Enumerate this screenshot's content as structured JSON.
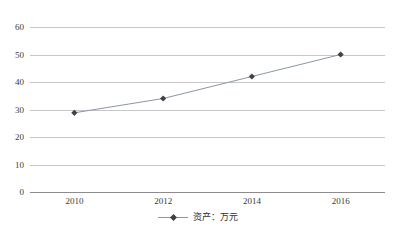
{
  "chart_data": {
    "type": "line",
    "title": "",
    "xlabel": "",
    "ylabel": "",
    "x": [
      "2010",
      "2012",
      "2014",
      "2016"
    ],
    "categories": [
      "2010",
      "2012",
      "2014",
      "2016"
    ],
    "series": [
      {
        "name": "资产：万元",
        "values": [
          28.8,
          34.0,
          42.0,
          50.0
        ],
        "marker": "diamond",
        "line_color": "#8b95a8",
        "marker_color": "#40404a"
      }
    ],
    "ylim": [
      0,
      60
    ],
    "yticks": [
      0,
      10,
      20,
      30,
      40,
      50,
      60
    ],
    "ytick_labels": [
      "0",
      "10",
      "20",
      "30",
      "40",
      "50",
      "60"
    ],
    "xtick_labels": [
      "2010",
      "2012",
      "2014",
      "2016"
    ],
    "grid": true,
    "grid_axis": "y",
    "grid_color": "#c8c8c8",
    "axis_color": "#8c8c8c",
    "legend": {
      "position": "bottom",
      "entries": [
        "资产：万元"
      ]
    },
    "background": "#ffffff"
  }
}
